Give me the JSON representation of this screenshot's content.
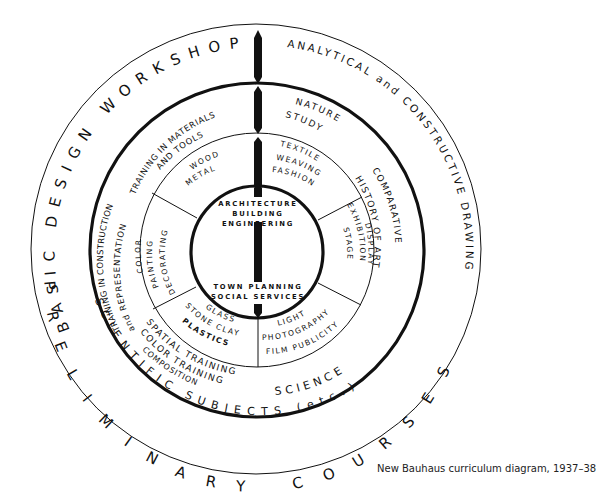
{
  "title": "New Bauhaus curriculum diagram",
  "caption": "New Bauhaus curriculum diagram, 1937–38",
  "colors": {
    "line": "#111111",
    "background": "#ffffff"
  },
  "outer_ring": {
    "top": "BASIC DESIGN WORKSHOP",
    "top_right": "ANALYTICAL and CONSTRUCTIVE DRAWING",
    "bottom": "PRELIMINARY COURSES",
    "bottom_left": "PRE",
    "bottom_mid": "SCIENTIFIC SUBJECTS (etc.)"
  },
  "middle_ring": {
    "left_line1": "TRAINING IN CONSTRUCTION",
    "left_line2": "and REPRESENTATION",
    "top_line1": "TRAINING IN MATERIALS",
    "top_line2": "AND TOOLS",
    "top_right_line1": "NATURE",
    "top_right_line2": "STUDY",
    "right_line1": "COMPARATIVE",
    "right_line2": "HISTORY OF ART",
    "bottom_left_line1": "SPATIAL TRAINING",
    "bottom_left_line2": "COLOR TRAINING",
    "bottom_left_line3": "COMPOSITION",
    "bottom_right": "SCIENCE"
  },
  "workshops": [
    {
      "lines": [
        "WOOD",
        "METAL"
      ]
    },
    {
      "lines": [
        "TEXTILE",
        "WEAVING",
        "FASHION"
      ]
    },
    {
      "lines": [
        "DISPLAY",
        "EXHIBITION",
        "STAGE"
      ]
    },
    {
      "lines": [
        "LIGHT",
        "PHOTOGRAPHY",
        "FILM PUBLICITY"
      ]
    },
    {
      "lines": [
        "GLASS",
        "STONE CLAY",
        "PLASTICS"
      ]
    },
    {
      "lines": [
        "COLOR",
        "PAINTING",
        "DECORATING"
      ]
    }
  ],
  "core": {
    "top_line1": "ARCHITECTURE",
    "top_line2": "BUILDING",
    "top_line3": "ENGINEERING",
    "bottom_line1": "TOWN PLANNING",
    "bottom_line2": "SOCIAL SERVICES"
  },
  "axis_bars": {
    "label": "YEARS",
    "count": 3
  }
}
